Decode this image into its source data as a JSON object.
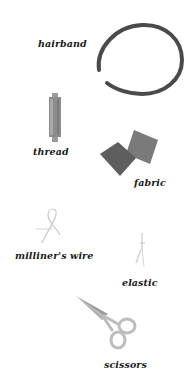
{
  "items": [
    {
      "id": "hairband",
      "label": "hairband",
      "color": "#4a4a4a"
    },
    {
      "id": "thread",
      "label": "thread",
      "color": "#8c8c8c"
    },
    {
      "id": "fabric",
      "label": "fabric",
      "color": "#6e6e6e"
    },
    {
      "id": "milliners_wire",
      "label": "milliner's wire",
      "color": "#c8c8c8"
    },
    {
      "id": "elastic",
      "label": "elastic",
      "color": "#cfcfcf"
    },
    {
      "id": "scissors",
      "label": "scissors",
      "color": "#b5b5b5"
    }
  ]
}
